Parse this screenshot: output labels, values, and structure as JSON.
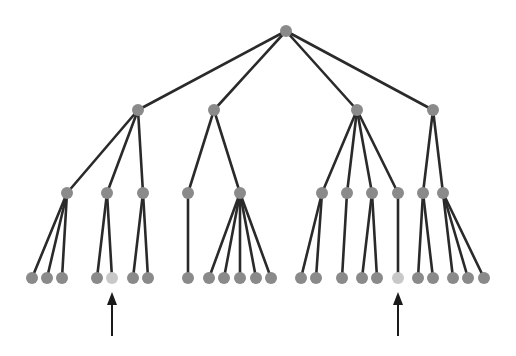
{
  "diagram": {
    "type": "tree",
    "colors": {
      "edge": "#2a2a2a",
      "node": "#8a8a8a",
      "highlight_node": "#c8c8c8",
      "arrow": "#1a1a1a",
      "background": "#ffffff"
    },
    "node_radius": 6,
    "nodes": [
      {
        "id": "r",
        "x": 286,
        "y": 31,
        "level": 0
      },
      {
        "id": "a",
        "x": 138,
        "y": 110,
        "level": 1,
        "parent": "r"
      },
      {
        "id": "b",
        "x": 214,
        "y": 110,
        "level": 1,
        "parent": "r"
      },
      {
        "id": "c",
        "x": 357,
        "y": 110,
        "level": 1,
        "parent": "r"
      },
      {
        "id": "d",
        "x": 433,
        "y": 110,
        "level": 1,
        "parent": "r"
      },
      {
        "id": "a1",
        "x": 67,
        "y": 193,
        "level": 2,
        "parent": "a"
      },
      {
        "id": "a2",
        "x": 107,
        "y": 193,
        "level": 2,
        "parent": "a"
      },
      {
        "id": "a3",
        "x": 143,
        "y": 193,
        "level": 2,
        "parent": "a"
      },
      {
        "id": "b1",
        "x": 188,
        "y": 193,
        "level": 2,
        "parent": "b"
      },
      {
        "id": "b2",
        "x": 240,
        "y": 193,
        "level": 2,
        "parent": "b"
      },
      {
        "id": "c1",
        "x": 322,
        "y": 193,
        "level": 2,
        "parent": "c"
      },
      {
        "id": "c2",
        "x": 347,
        "y": 193,
        "level": 2,
        "parent": "c"
      },
      {
        "id": "c3",
        "x": 372,
        "y": 193,
        "level": 2,
        "parent": "c"
      },
      {
        "id": "c4",
        "x": 398,
        "y": 193,
        "level": 2,
        "parent": "c"
      },
      {
        "id": "d1",
        "x": 423,
        "y": 193,
        "level": 2,
        "parent": "d"
      },
      {
        "id": "d2",
        "x": 443,
        "y": 193,
        "level": 2,
        "parent": "d"
      },
      {
        "id": "l1",
        "x": 32,
        "y": 278,
        "level": 3,
        "parent": "a1"
      },
      {
        "id": "l2",
        "x": 47,
        "y": 278,
        "level": 3,
        "parent": "a1"
      },
      {
        "id": "l3",
        "x": 62,
        "y": 278,
        "level": 3,
        "parent": "a1"
      },
      {
        "id": "l4",
        "x": 97,
        "y": 278,
        "level": 3,
        "parent": "a2"
      },
      {
        "id": "l5",
        "x": 112,
        "y": 278,
        "level": 3,
        "parent": "a2",
        "highlight": true
      },
      {
        "id": "l6",
        "x": 133,
        "y": 278,
        "level": 3,
        "parent": "a3"
      },
      {
        "id": "l7",
        "x": 148,
        "y": 278,
        "level": 3,
        "parent": "a3"
      },
      {
        "id": "l8",
        "x": 188,
        "y": 278,
        "level": 3,
        "parent": "b1"
      },
      {
        "id": "l9",
        "x": 209,
        "y": 278,
        "level": 3,
        "parent": "b2"
      },
      {
        "id": "l10",
        "x": 224,
        "y": 278,
        "level": 3,
        "parent": "b2"
      },
      {
        "id": "l11",
        "x": 240,
        "y": 278,
        "level": 3,
        "parent": "b2"
      },
      {
        "id": "l12",
        "x": 256,
        "y": 278,
        "level": 3,
        "parent": "b2"
      },
      {
        "id": "l13",
        "x": 271,
        "y": 278,
        "level": 3,
        "parent": "b2"
      },
      {
        "id": "l14",
        "x": 301,
        "y": 278,
        "level": 3,
        "parent": "c1"
      },
      {
        "id": "l15",
        "x": 316,
        "y": 278,
        "level": 3,
        "parent": "c1"
      },
      {
        "id": "l16",
        "x": 342,
        "y": 278,
        "level": 3,
        "parent": "c2"
      },
      {
        "id": "l17",
        "x": 362,
        "y": 278,
        "level": 3,
        "parent": "c3"
      },
      {
        "id": "l18",
        "x": 377,
        "y": 278,
        "level": 3,
        "parent": "c3"
      },
      {
        "id": "l19",
        "x": 398,
        "y": 278,
        "level": 3,
        "parent": "c4",
        "highlight": true
      },
      {
        "id": "l20",
        "x": 418,
        "y": 278,
        "level": 3,
        "parent": "d1"
      },
      {
        "id": "l21",
        "x": 433,
        "y": 278,
        "level": 3,
        "parent": "d1"
      },
      {
        "id": "l22",
        "x": 453,
        "y": 278,
        "level": 3,
        "parent": "d2"
      },
      {
        "id": "l23",
        "x": 468,
        "y": 278,
        "level": 3,
        "parent": "d2"
      },
      {
        "id": "l24",
        "x": 484,
        "y": 278,
        "level": 3,
        "parent": "d2"
      }
    ],
    "arrows": [
      {
        "x": 112,
        "y_tip": 292,
        "y_tail": 336,
        "points_to": "l5"
      },
      {
        "x": 398,
        "y_tip": 292,
        "y_tail": 336,
        "points_to": "l19"
      }
    ]
  }
}
